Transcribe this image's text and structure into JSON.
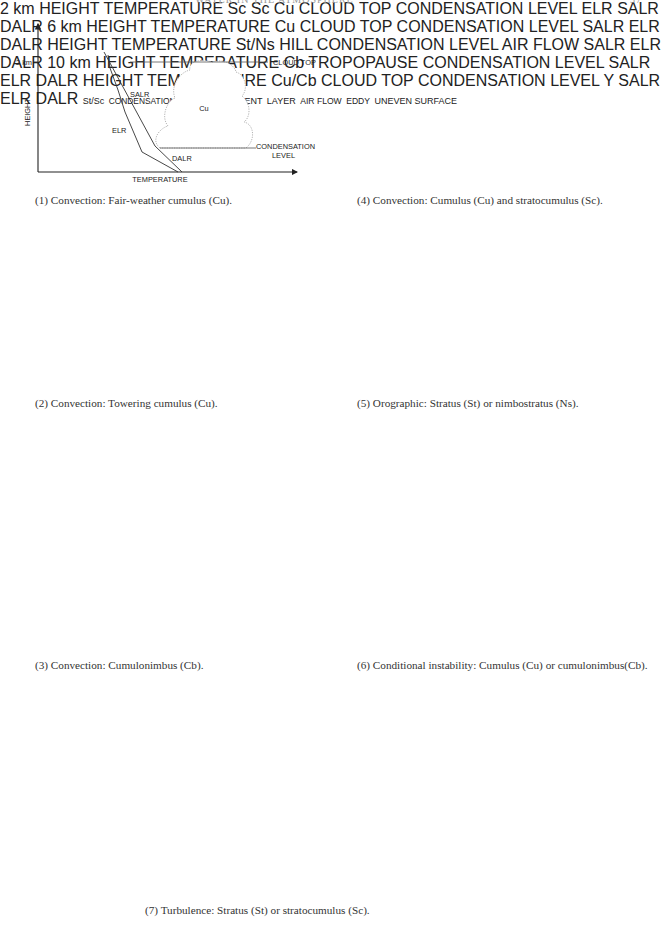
{
  "page_header": {
    "title": "WATER IN THE ATMOSPHERE",
    "page_number": "37"
  },
  "common_labels": {
    "x_axis": "TEMPERATURE",
    "y_axis": "HEIGHT",
    "salr": "SALR",
    "elr": "ELR",
    "dalr": "DALR",
    "cloud_top": "CLOUD TOP",
    "condensation": "CONDENSATION",
    "level": "LEVEL"
  },
  "panels": [
    {
      "id": 1,
      "caption": "(1) Convection: Fair-weather cumulus (Cu).",
      "height_tick": "2 km",
      "cloud_label": "Cu"
    },
    {
      "id": 2,
      "caption": "(2) Convection: Towering cumulus (Cu).",
      "height_tick": "6 km",
      "cloud_label": "Cu"
    },
    {
      "id": 3,
      "caption": "(3) Convection: Cumulonimbus (Cb).",
      "height_tick": "10 km",
      "cloud_label": "Cb",
      "top_label": "TROPOPAUSE"
    },
    {
      "id": 4,
      "caption": "(4) Convection: Cumulus (Cu) and stratocumulus (Sc).",
      "height_tick": "2 km",
      "cloud_label": "Cu",
      "side_cloud_label": "Sc"
    },
    {
      "id": 5,
      "caption": "(5) Orographic: Stratus (St) or nimbostratus (Ns).",
      "cloud_label": "St/Ns",
      "hill_label": "HILL",
      "air_flow": "AIR FLOW"
    },
    {
      "id": 6,
      "caption": "(6)  Conditional instability: Cumulus (Cu) or cumulonimbus(Cb).",
      "cloud_label": "Cu/Cb",
      "point_label": "Y"
    },
    {
      "id": 7,
      "caption": "(7) Turbulence: Stratus (St) or stratocumulus (Sc).",
      "cloud_label": "St/Sc",
      "condensation_level": "CONDENSATION LEVEL",
      "air_flow": "AIR FLOW",
      "turbulent": "TURBULENT",
      "layer": "LAYER",
      "eddy": "EDDY",
      "surface": "UNEVEN SURFACE"
    }
  ]
}
